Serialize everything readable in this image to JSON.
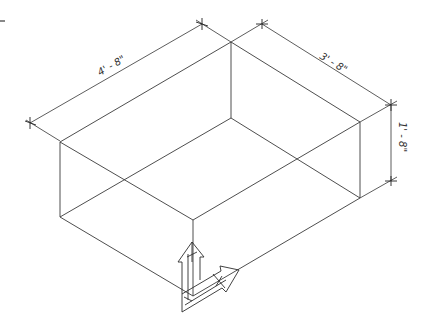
{
  "drawing": {
    "type": "isometric box with dimensions",
    "stroke_color": "#3a3a3a",
    "background": "#ffffff",
    "dimensions": {
      "length": "4' - 8\"",
      "width": "3' - 8\"",
      "height": "1' - 8\""
    },
    "vertices": {
      "top_left": [
        60,
        142
      ],
      "top_back": [
        231,
        42
      ],
      "top_right": [
        360,
        122
      ],
      "top_front": [
        193,
        220
      ],
      "bottom_left": [
        60,
        217
      ],
      "bottom_back": [
        231,
        118
      ],
      "bottom_right": [
        360,
        198
      ],
      "bottom_front": [
        193,
        296
      ]
    },
    "ucs_icon": "ucs-axis-icon"
  }
}
